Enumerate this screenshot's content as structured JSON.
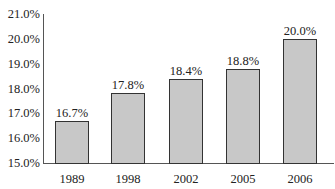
{
  "chart_data": {
    "type": "bar",
    "title": "",
    "xlabel": "",
    "ylabel": "",
    "categories": [
      "1989",
      "1998",
      "2002",
      "2005",
      "2006"
    ],
    "values": [
      16.7,
      17.8,
      18.4,
      18.8,
      20.0
    ],
    "value_labels": [
      "16.7%",
      "17.8%",
      "18.4%",
      "18.8%",
      "20.0%"
    ],
    "ylim": [
      15.0,
      21.0
    ],
    "yticks": [
      15.0,
      16.0,
      17.0,
      18.0,
      19.0,
      20.0,
      21.0
    ],
    "ytick_labels": [
      "15.0%",
      "16.0%",
      "17.0%",
      "18.0%",
      "19.0%",
      "20.0%",
      "21.0%"
    ],
    "grid": false,
    "legend": null,
    "bar_color": "#c8c8c8",
    "bar_edge_color": "#333333"
  }
}
